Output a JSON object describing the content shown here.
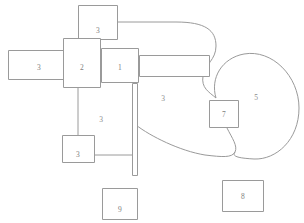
{
  "diagram": {
    "canvas": {
      "width": 304,
      "height": 223
    },
    "colors": {
      "background": "#ffffff",
      "stroke": "#9a9a9a",
      "label_text": "#808080",
      "free_label_text": "#8c8c8c"
    },
    "nodes": [
      {
        "id": "node-top-3",
        "label": "3",
        "shape": "rectangle",
        "x": 78,
        "y": 5,
        "w": 40,
        "h": 35,
        "label_x": 98,
        "label_y": 31
      },
      {
        "id": "node-left-3",
        "label": "3",
        "shape": "rectangle",
        "x": 8,
        "y": 50,
        "w": 57,
        "h": 30,
        "label_x": 39,
        "label_y": 68
      },
      {
        "id": "node-2",
        "label": "2",
        "shape": "rectangle",
        "x": 63,
        "y": 38,
        "w": 38,
        "h": 50,
        "label_x": 82,
        "label_y": 68
      },
      {
        "id": "node-1",
        "label": "1",
        "shape": "rectangle",
        "x": 101,
        "y": 48,
        "w": 38,
        "h": 35,
        "label_x": 120,
        "label_y": 68
      },
      {
        "id": "node-right-bar",
        "label": "",
        "shape": "rectangle",
        "x": 139,
        "y": 55,
        "w": 71,
        "h": 22,
        "label_x": 175,
        "label_y": 66
      },
      {
        "id": "node-lower-3",
        "label": "3",
        "shape": "rectangle",
        "x": 62,
        "y": 135,
        "w": 33,
        "h": 28,
        "label_x": 78,
        "label_y": 155
      },
      {
        "id": "node-7",
        "label": "7",
        "shape": "rectangle",
        "x": 209,
        "y": 100,
        "w": 30,
        "h": 28,
        "label_x": 224,
        "label_y": 115
      },
      {
        "id": "node-9",
        "label": "9",
        "shape": "rectangle",
        "x": 102,
        "y": 188,
        "w": 36,
        "h": 32,
        "label_x": 120,
        "label_y": 210
      },
      {
        "id": "node-8",
        "label": "8",
        "shape": "rectangle",
        "x": 222,
        "y": 180,
        "w": 42,
        "h": 32,
        "label_x": 243,
        "label_y": 197
      },
      {
        "id": "node-vertical-bar",
        "label": "",
        "shape": "rectangle",
        "x": 132,
        "y": 83,
        "w": 6,
        "h": 93,
        "label_x": 135,
        "label_y": 130
      }
    ],
    "free_labels": [
      {
        "id": "label-region-3-mid",
        "text": "3",
        "x": 163,
        "y": 99
      },
      {
        "id": "label-region-3-lowerleft",
        "text": "3",
        "x": 101,
        "y": 120
      },
      {
        "id": "label-region-5",
        "text": "5",
        "x": 256,
        "y": 98
      }
    ],
    "connectors": [
      {
        "id": "connector-top-to-oval",
        "path": "M 118 22 L 176 22 C 205 22 216 30 216 46 C 216 60 205 64 203 76 C 201 88 209 92 216 98"
      },
      {
        "id": "connector-node7-to-bar",
        "path": "M 227 128 C 232 138 238 146 235 152 C 232 158 222 157 205 155 C 180 151 150 136 136 125"
      },
      {
        "id": "connector-oval-right",
        "path": "M 216 98 C 210 78 222 58 244 54 C 272 49 299 76 299 108 C 299 140 276 160 254 159 C 236 158 232 156 235 152"
      },
      {
        "id": "connector-node2-to-lower3",
        "path": "M 78 88 L 78 135"
      },
      {
        "id": "connector-lower3-to-bar",
        "path": "M 95 155 L 132 155"
      },
      {
        "id": "connector-node1-to-bar",
        "path": "M 135 83 L 135 83"
      }
    ]
  }
}
